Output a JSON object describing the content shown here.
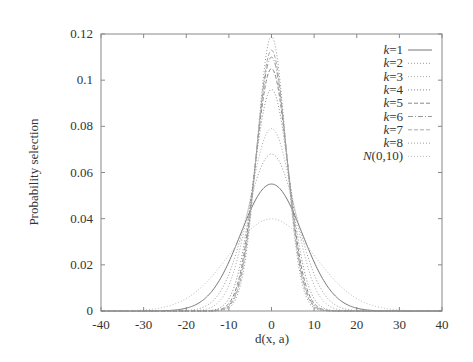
{
  "chart_data": {
    "type": "line",
    "title": "",
    "xlabel": "d(x, a)",
    "ylabel": "Probability selection",
    "xlim": [
      -40,
      40
    ],
    "ylim": [
      0,
      0.12
    ],
    "xticks": [
      "-40",
      "-30",
      "-20",
      "-10",
      "0",
      "10",
      "20",
      "30",
      "40"
    ],
    "xtick_values": [
      -40,
      -30,
      -20,
      -10,
      0,
      10,
      20,
      30,
      40
    ],
    "yticks": [
      "0",
      "0.02",
      "0.04",
      "0.06",
      "0.08",
      "0.1",
      "0.12"
    ],
    "ytick_values": [
      0,
      0.02,
      0.04,
      0.06,
      0.08,
      0.1,
      0.12
    ],
    "grid": false,
    "legend_position": "top-right",
    "x": [
      -40,
      -35,
      -30,
      -25,
      -20,
      -18,
      -16,
      -14,
      -12,
      -10,
      -9,
      -8,
      -7,
      -6,
      -5,
      -4,
      -3,
      -2,
      -1,
      0,
      1,
      2,
      3,
      4,
      5,
      6,
      7,
      8,
      9,
      10,
      12,
      14,
      16,
      18,
      20,
      25,
      30,
      35,
      40
    ],
    "series": [
      {
        "name": "k=1",
        "var": "k",
        "num": "1",
        "style": "solid",
        "color": "#777777",
        "peak": 0.055,
        "sigma": 7.25
      },
      {
        "name": "k=2",
        "var": "k",
        "num": "2",
        "style": "dotted",
        "color": "#999999",
        "peak": 0.068,
        "sigma": 5.87
      },
      {
        "name": "k=3",
        "var": "k",
        "num": "3",
        "style": "dotted",
        "color": "#aaaaaa",
        "peak": 0.079,
        "sigma": 5.05
      },
      {
        "name": "k=4",
        "var": "k",
        "num": "4",
        "style": "dotted",
        "color": "#888888",
        "peak": 0.096,
        "sigma": 4.16
      },
      {
        "name": "k=5",
        "var": "k",
        "num": "5",
        "style": "dashed",
        "color": "#888888",
        "peak": 0.105,
        "sigma": 3.8
      },
      {
        "name": "k=6",
        "var": "k",
        "num": "6",
        "style": "dashdot",
        "color": "#999999",
        "peak": 0.11,
        "sigma": 3.63
      },
      {
        "name": "k=7",
        "var": "k",
        "num": "7",
        "style": "dashed",
        "color": "#aaaaaa",
        "peak": 0.113,
        "sigma": 3.53
      },
      {
        "name": "k=8",
        "var": "k",
        "num": "8",
        "style": "dotted",
        "color": "#999999",
        "peak": 0.119,
        "sigma": 3.35
      },
      {
        "name": "N(0,10)",
        "var": "N",
        "num": "(0,10)",
        "style": "dotted",
        "color": "#bbbbbb",
        "peak": 0.0399,
        "sigma": 10
      }
    ]
  }
}
